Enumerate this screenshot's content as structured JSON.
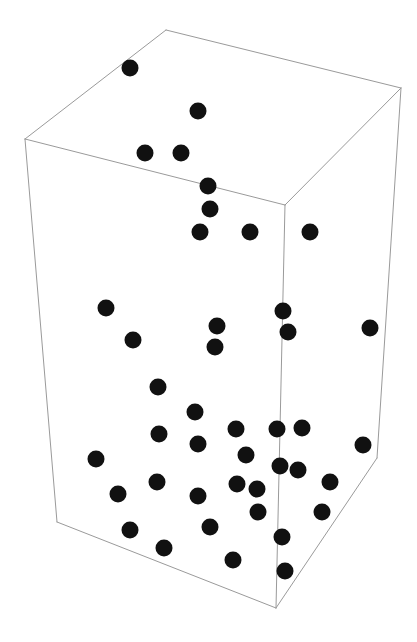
{
  "figure": {
    "title": "",
    "width": 417,
    "height": 642,
    "background_color": "#ffffff",
    "box_edge_color": "#9a9a9a",
    "point_color": "#111111",
    "point_radius": 8.5
  },
  "chart_data": {
    "type": "scatter",
    "title": "",
    "xlabel": "",
    "ylabel": "",
    "zlabel": "",
    "projection": "3d",
    "grid": false,
    "legend": null,
    "axis_ticks": [],
    "marker": {
      "shape": "circle",
      "color": "#111111",
      "size": 17
    },
    "box": {
      "note": "3D bounding cube drawn as wireframe in oblique projection",
      "vertices_px": {
        "top_back_left": [
          166,
          30
        ],
        "top_back_right": [
          401,
          88
        ],
        "top_front_left": [
          25,
          139
        ],
        "top_front_mid": [
          285,
          205
        ],
        "bottom_front_left": [
          57,
          522
        ],
        "bottom_front_mid": [
          276,
          608
        ],
        "bottom_back_right": [
          377,
          458
        ]
      },
      "edges": [
        [
          "top_back_left",
          "top_back_right"
        ],
        [
          "top_back_left",
          "top_front_left"
        ],
        [
          "top_back_right",
          "top_front_mid"
        ],
        [
          "top_front_left",
          "top_front_mid"
        ],
        [
          "top_front_left",
          "bottom_front_left"
        ],
        [
          "top_front_mid",
          "bottom_front_mid"
        ],
        [
          "top_back_right",
          "bottom_back_right"
        ],
        [
          "bottom_front_left",
          "bottom_front_mid"
        ],
        [
          "bottom_front_mid",
          "bottom_back_right"
        ]
      ]
    },
    "points_px": [
      [
        130,
        68
      ],
      [
        198,
        111
      ],
      [
        145,
        153
      ],
      [
        181,
        153
      ],
      [
        208,
        186
      ],
      [
        210,
        209
      ],
      [
        200,
        232
      ],
      [
        250,
        232
      ],
      [
        310,
        232
      ],
      [
        106,
        308
      ],
      [
        133,
        340
      ],
      [
        217,
        326
      ],
      [
        215,
        347
      ],
      [
        283,
        311
      ],
      [
        288,
        332
      ],
      [
        370,
        328
      ],
      [
        158,
        387
      ],
      [
        195,
        412
      ],
      [
        159,
        434
      ],
      [
        236,
        429
      ],
      [
        277,
        429
      ],
      [
        302,
        428
      ],
      [
        363,
        445
      ],
      [
        198,
        444
      ],
      [
        246,
        455
      ],
      [
        280,
        466
      ],
      [
        298,
        470
      ],
      [
        96,
        459
      ],
      [
        157,
        482
      ],
      [
        237,
        484
      ],
      [
        257,
        489
      ],
      [
        330,
        482
      ],
      [
        118,
        494
      ],
      [
        198,
        496
      ],
      [
        258,
        512
      ],
      [
        322,
        512
      ],
      [
        130,
        530
      ],
      [
        210,
        527
      ],
      [
        282,
        537
      ],
      [
        164,
        548
      ],
      [
        233,
        560
      ],
      [
        285,
        571
      ]
    ],
    "point_count": 42
  }
}
